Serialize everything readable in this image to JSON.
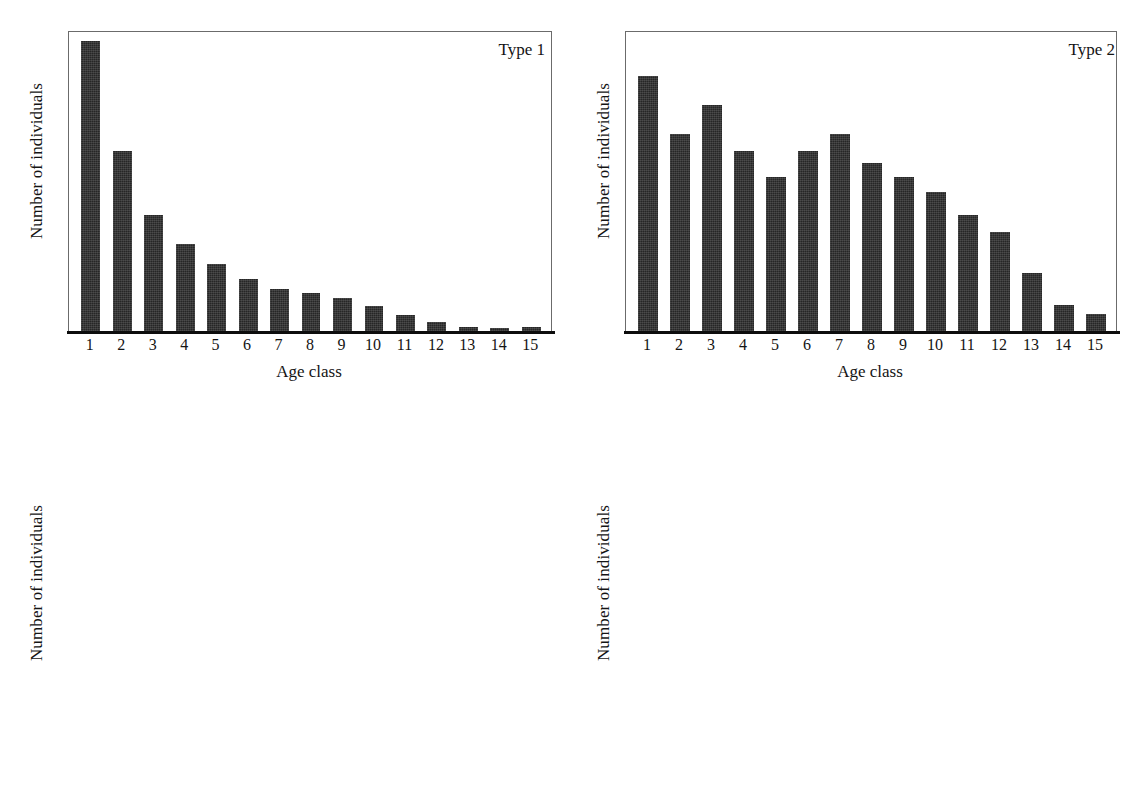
{
  "figure": {
    "background_color": "#ffffff",
    "bar_color": "#262626",
    "axis_color": "#0d0d0d",
    "frame_color": "#6b6b6b",
    "panel_count": 4
  },
  "chart_data": [
    {
      "type": "bar",
      "title": "Type 1",
      "xlabel": "Age class",
      "ylabel": "Number of individuals",
      "grid": false,
      "legend": "none",
      "categories": [
        "1",
        "2",
        "3",
        "4",
        "5",
        "6",
        "7",
        "8",
        "9",
        "10",
        "11",
        "12",
        "13",
        "14",
        "15"
      ],
      "values": [
        100,
        62,
        40,
        30,
        23,
        18,
        14.5,
        13,
        11.5,
        8.5,
        5.5,
        3,
        1.5,
        1,
        1.5
      ],
      "ylim": [
        0,
        103
      ],
      "yticks": [],
      "note": "values are percent of panel plot height; y axis is unlabeled"
    },
    {
      "type": "bar",
      "title": "Type 2",
      "xlabel": "Age class",
      "ylabel": "Number of individuals",
      "grid": false,
      "legend": "none",
      "categories": [
        "1",
        "2",
        "3",
        "4",
        "5",
        "6",
        "7",
        "8",
        "9",
        "10",
        "11",
        "12",
        "13",
        "14",
        "15"
      ],
      "values": [
        88,
        68,
        78,
        62,
        53,
        62,
        68,
        58,
        53,
        48,
        40,
        34,
        20,
        9,
        6
      ],
      "ylim": [
        0,
        103
      ],
      "yticks": [],
      "note": "values are percent of panel plot height; y axis is unlabeled"
    },
    {
      "type": "bar",
      "title": "Type 3",
      "xlabel": "Age class",
      "ylabel": "Number of individuals",
      "grid": false,
      "legend": "none",
      "categories": [
        "1",
        "2",
        "3",
        "4",
        "5",
        "6",
        "7",
        "8",
        "9",
        "10",
        "11",
        "12",
        "13",
        "14",
        "15"
      ],
      "values": [
        1,
        10,
        26,
        83,
        100,
        96,
        65,
        70,
        52,
        43,
        16,
        5,
        0,
        0,
        0
      ],
      "ylim": [
        0,
        100
      ],
      "yticks": [],
      "note": "values are percent of panel plot height; y axis is unlabeled"
    },
    {
      "type": "bar",
      "title": "Type 4",
      "xlabel": "Age class",
      "ylabel": "Number of individuals",
      "grid": false,
      "legend": "none",
      "categories": [
        "1",
        "2",
        "3",
        "4",
        "5",
        "6",
        "7",
        "8",
        "9",
        "10",
        "11",
        "12",
        "13",
        "14",
        "15"
      ],
      "values": [
        97,
        92,
        57,
        53,
        1,
        3,
        6,
        22,
        55,
        62,
        48,
        55,
        43,
        7,
        0
      ],
      "ylim": [
        0,
        103
      ],
      "yticks": [],
      "note": "values are percent of panel plot height; y axis is unlabeled"
    }
  ]
}
